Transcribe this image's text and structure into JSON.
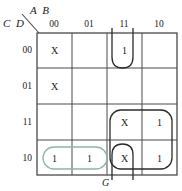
{
  "diagram": {
    "type": "karnaugh-map",
    "title_top_left": "A B",
    "title_bottom_left": "C D",
    "output_label": "G",
    "column_headers": [
      "00",
      "01",
      "11",
      "10"
    ],
    "row_headers": [
      "00",
      "01",
      "11",
      "10"
    ],
    "colors": {
      "grid": "#4a4a4a",
      "text": "#1a1a1a",
      "group_black": "#2b2b2b",
      "group_teal": "#8fb3ad"
    },
    "cells": [
      {
        "row": "00",
        "col": "00",
        "value": "X"
      },
      {
        "row": "00",
        "col": "01",
        "value": ""
      },
      {
        "row": "00",
        "col": "11",
        "value": "1"
      },
      {
        "row": "00",
        "col": "10",
        "value": ""
      },
      {
        "row": "01",
        "col": "00",
        "value": "X"
      },
      {
        "row": "01",
        "col": "01",
        "value": ""
      },
      {
        "row": "01",
        "col": "11",
        "value": ""
      },
      {
        "row": "01",
        "col": "10",
        "value": ""
      },
      {
        "row": "11",
        "col": "00",
        "value": ""
      },
      {
        "row": "11",
        "col": "01",
        "value": ""
      },
      {
        "row": "11",
        "col": "11",
        "value": "X"
      },
      {
        "row": "11",
        "col": "10",
        "value": "1"
      },
      {
        "row": "10",
        "col": "00",
        "value": "1"
      },
      {
        "row": "10",
        "col": "01",
        "value": "1"
      },
      {
        "row": "10",
        "col": "11",
        "value": "X"
      },
      {
        "row": "10",
        "col": "10",
        "value": "1"
      }
    ],
    "groups": [
      {
        "name": "teal-pair-row10-cols00-01",
        "color": "#8fb3ad",
        "cells": [
          "10/00",
          "10/01"
        ]
      },
      {
        "name": "black-quad-rows11-10-cols11-10",
        "color": "#2b2b2b",
        "cells": [
          "11/11",
          "11/10",
          "10/11",
          "10/10"
        ]
      },
      {
        "name": "black-wrap-col11-rows00-10",
        "color": "#2b2b2b",
        "cells": [
          "00/11",
          "10/11"
        ]
      }
    ]
  }
}
